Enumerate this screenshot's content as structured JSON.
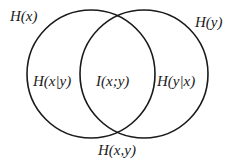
{
  "diagram": {
    "type": "venn",
    "stroke_color": "#1a1a1a",
    "background": "#ffffff",
    "circles": [
      {
        "id": "left",
        "represents": "H(x)",
        "cx": 91,
        "cy": 74,
        "r": 64
      },
      {
        "id": "right",
        "represents": "H(y)",
        "cx": 144,
        "cy": 74,
        "r": 64
      }
    ],
    "labels": {
      "h_x": "H(x)",
      "h_y": "H(y)",
      "h_x_given_y": "H(x|y)",
      "mutual_info": "I(x;y)",
      "h_y_given_x": "H(y|x)",
      "h_xy": "H(x,y)"
    }
  }
}
